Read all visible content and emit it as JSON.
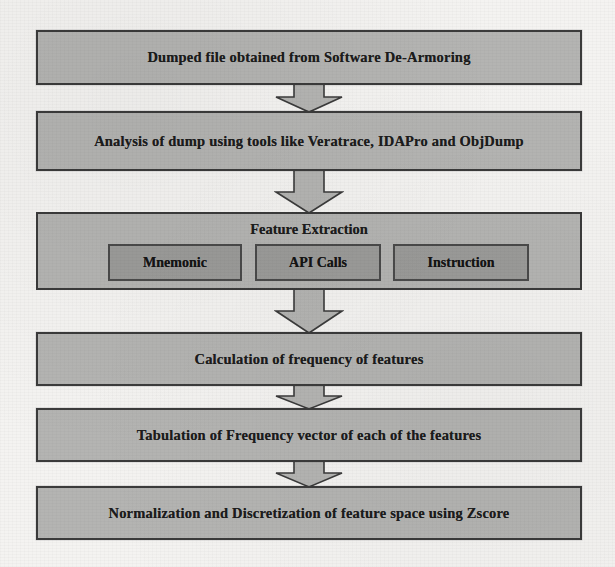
{
  "diagram": {
    "type": "flowchart",
    "orientation": "top-to-bottom",
    "colors": {
      "page_background": "#f4f3f1",
      "node_fill": "#b4b4b2",
      "node_border": "#3b3b3b",
      "subnode_fill": "#9b9b99",
      "subnode_border": "#4a4a4a",
      "text": "#1c1c1c",
      "arrow_fill": "#b4b4b2",
      "arrow_stroke": "#3b3b3b"
    },
    "nodes": [
      {
        "id": "dumped-file",
        "label": "Dumped file obtained from Software De-Armoring",
        "x": 36,
        "y": 30,
        "w": 546,
        "h": 55
      },
      {
        "id": "analysis-of-dump",
        "label": "Analysis of dump  using tools like Veratrace, IDAPro and ObjDump",
        "x": 36,
        "y": 111,
        "w": 546,
        "h": 60
      },
      {
        "id": "calculation-of-frequency",
        "label": "Calculation of frequency of features",
        "x": 36,
        "y": 332,
        "w": 546,
        "h": 54
      },
      {
        "id": "tabulation-of-frequency-vector",
        "label": "Tabulation of Frequency vector of each of the features",
        "x": 36,
        "y": 408,
        "w": 546,
        "h": 54
      },
      {
        "id": "normalization-discretization",
        "label": "Normalization and Discretization of feature space using Zscore",
        "x": 36,
        "y": 486,
        "w": 546,
        "h": 54
      }
    ],
    "group": {
      "id": "feature-extraction",
      "title": "Feature Extraction",
      "x": 36,
      "y": 212,
      "w": 546,
      "h": 78,
      "children": [
        {
          "id": "mnemonic",
          "label": "Mnemonic",
          "x": 70,
          "y": 30,
          "w": 134,
          "h": 37
        },
        {
          "id": "api-calls",
          "label": "API Calls",
          "x": 217,
          "y": 30,
          "w": 126,
          "h": 37
        },
        {
          "id": "instruction",
          "label": "Instruction",
          "x": 355,
          "y": 30,
          "w": 136,
          "h": 37
        }
      ]
    },
    "connectors": [
      {
        "id": "arrow-1",
        "from": "dumped-file",
        "to": "analysis-of-dump",
        "x": 274,
        "y": 84,
        "w": 70,
        "h": 29
      },
      {
        "id": "arrow-2",
        "from": "analysis-of-dump",
        "to": "feature-extraction",
        "x": 274,
        "y": 170,
        "w": 70,
        "h": 44
      },
      {
        "id": "arrow-3",
        "from": "feature-extraction",
        "to": "calculation-of-frequency",
        "x": 274,
        "y": 289,
        "w": 70,
        "h": 45
      },
      {
        "id": "arrow-4",
        "from": "calculation-of-frequency",
        "to": "tabulation-of-frequency-vector",
        "x": 274,
        "y": 385,
        "w": 70,
        "h": 25
      },
      {
        "id": "arrow-5",
        "from": "tabulation-of-frequency-vector",
        "to": "normalization-discretization",
        "x": 274,
        "y": 461,
        "w": 70,
        "h": 27
      }
    ]
  }
}
